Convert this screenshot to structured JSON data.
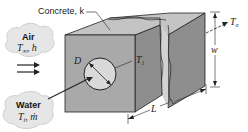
{
  "diagram": {
    "labels": {
      "material": "Concrete, k",
      "diameter": "D",
      "pipe_temp": "T",
      "pipe_temp_sub": "1",
      "outer_temp": "T",
      "outer_temp_sub": "o",
      "width": "w",
      "length": "L"
    },
    "air_cloud": {
      "name": "Air",
      "temp": "T",
      "temp_sub": "∞",
      "coef": ", h"
    },
    "water_cloud": {
      "name": "Water",
      "temp": "T",
      "temp_sub": "i",
      "flow": ", ṁ"
    },
    "colors": {
      "front_face": "#a9a9a9",
      "top_face": "#c4c4c4",
      "side_face": "#8e8e8e",
      "pipe": "#d9d9d9",
      "cloud": "#e6e6e6",
      "line": "#222222"
    }
  }
}
